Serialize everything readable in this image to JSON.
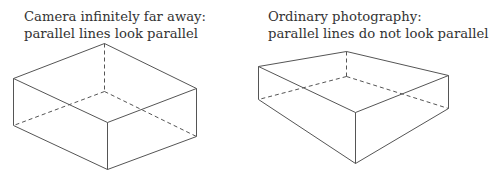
{
  "panels": [
    {
      "id": "orthographic",
      "caption": {
        "line1": "Camera infinitely far away:",
        "line2": "parallel lines look parallel"
      },
      "box": {
        "visible_edges": [
          [
            104,
            43,
            13,
            78
          ],
          [
            104,
            43,
            196,
            88
          ],
          [
            13,
            78,
            107,
            122
          ],
          [
            196,
            88,
            107,
            122
          ],
          [
            13,
            78,
            13,
            125
          ],
          [
            107,
            122,
            107,
            169
          ],
          [
            196,
            88,
            196,
            136
          ],
          [
            13,
            125,
            107,
            169
          ],
          [
            107,
            169,
            196,
            136
          ]
        ],
        "hidden_edges": [
          [
            104,
            43,
            104,
            91
          ],
          [
            104,
            91,
            13,
            125
          ],
          [
            104,
            91,
            196,
            136
          ]
        ]
      }
    },
    {
      "id": "perspective",
      "caption": {
        "line1": "Ordinary photography:",
        "line2": "parallel lines do not look parallel"
      },
      "box": {
        "visible_edges": [
          [
            258,
            66,
            346,
            51
          ],
          [
            346,
            51,
            448,
            75
          ],
          [
            258,
            66,
            355,
            112
          ],
          [
            448,
            75,
            355,
            112
          ],
          [
            258,
            66,
            258,
            99
          ],
          [
            355,
            112,
            355,
            163
          ],
          [
            448,
            75,
            448,
            108
          ],
          [
            258,
            99,
            355,
            163
          ],
          [
            355,
            163,
            448,
            108
          ]
        ],
        "hidden_edges": [
          [
            346,
            51,
            346,
            76
          ],
          [
            346,
            76,
            258,
            99
          ],
          [
            346,
            76,
            448,
            108
          ]
        ]
      }
    }
  ],
  "colors": {
    "line": "#555555",
    "text": "#333333",
    "background": "#ffffff"
  }
}
